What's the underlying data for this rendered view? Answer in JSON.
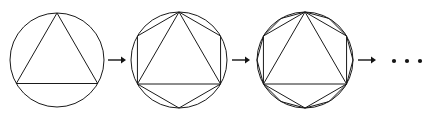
{
  "figure": {
    "caption": "",
    "background_color": "#ffffff",
    "stroke_color": "#1a1a1a",
    "arrow_color": "#141414",
    "width": 428,
    "height": 118
  },
  "chart_data": {
    "type": "diagram",
    "title": "",
    "subtitle": "",
    "xlabel": "",
    "ylabel": "",
    "legend": [],
    "annotations": [],
    "stages": [
      {
        "index": 1,
        "label": "",
        "circle": {
          "cx": 57,
          "cy": 60,
          "r": 47
        },
        "polygons": [
          {
            "sides": 3,
            "rotation_deg": -90,
            "name": "triangle"
          }
        ]
      },
      {
        "index": 2,
        "label": "",
        "circle": {
          "cx": 179,
          "cy": 60,
          "r": 48
        },
        "polygons": [
          {
            "sides": 3,
            "rotation_deg": -90,
            "name": "triangle"
          },
          {
            "sides": 6,
            "rotation_deg": -90,
            "name": "hexagon"
          }
        ]
      },
      {
        "index": 3,
        "label": "",
        "circle": {
          "cx": 305,
          "cy": 60,
          "r": 48
        },
        "polygons": [
          {
            "sides": 3,
            "rotation_deg": -90,
            "name": "triangle"
          },
          {
            "sides": 6,
            "rotation_deg": -90,
            "name": "hexagon"
          },
          {
            "sides": 12,
            "rotation_deg": -90,
            "name": "dodecagon"
          }
        ]
      }
    ],
    "arrows": [
      {
        "x1": 108,
        "x2": 126,
        "y": 60
      },
      {
        "x1": 232,
        "x2": 250,
        "y": 60
      },
      {
        "x1": 358,
        "x2": 376,
        "y": 60
      }
    ],
    "ellipsis": {
      "text": "...",
      "dots": [
        {
          "cx": 394,
          "cy": 61,
          "r": 2.1
        },
        {
          "cx": 407,
          "cy": 61,
          "r": 2.1
        },
        {
          "cx": 420,
          "cy": 61,
          "r": 2.1
        }
      ]
    }
  }
}
